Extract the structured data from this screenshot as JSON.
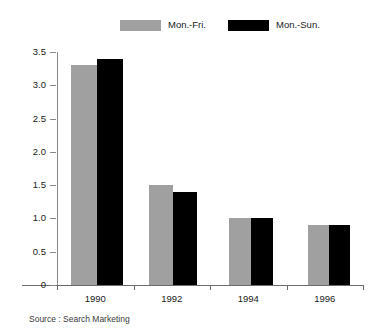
{
  "chart_data": {
    "type": "bar",
    "title": "",
    "subtitle": "",
    "xlabel": "",
    "ylabel": "",
    "categories": [
      "1990",
      "1992",
      "1994",
      "1996"
    ],
    "series": [
      {
        "name": "Mon.-Fri.",
        "color": "#a0a0a0",
        "values": [
          3.3,
          1.5,
          1.0,
          0.9
        ]
      },
      {
        "name": "Mon.-Sun.",
        "color": "#000000",
        "values": [
          3.4,
          1.4,
          1.0,
          0.9
        ]
      }
    ],
    "ylim": [
      0,
      3.5
    ],
    "ytick_labels": [
      "0",
      "0.5",
      "1.0",
      "1.5",
      "2.0",
      "2.5",
      "3.0",
      "3.5"
    ],
    "ytick_values": [
      0,
      0.5,
      1.0,
      1.5,
      2.0,
      2.5,
      3.0,
      3.5
    ],
    "grid": false,
    "legend_position": "top-center",
    "annotations": [
      "Source : Search Marketing"
    ]
  },
  "legend": {
    "items": [
      {
        "label": "Mon.-Fri.",
        "color": "#a0a0a0"
      },
      {
        "label": "Mon.-Sun.",
        "color": "#000000"
      }
    ]
  },
  "footer": {
    "source": "Source : Search Marketing"
  }
}
